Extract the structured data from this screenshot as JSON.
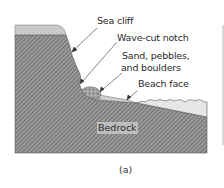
{
  "figure": {
    "caption": "(a)",
    "labels": {
      "sea_cliff": "Sea cliff",
      "wave_cut_notch": "Wave-cut notch",
      "sediment_line1": "Sand, pebbles,",
      "sediment_line2": "and boulders",
      "beach_face": "Beach face",
      "bedrock": "Bedrock"
    },
    "colors": {
      "bedrock_fill": "#8f8f8f",
      "bedrock_hatch": "#5e5e5e",
      "topsoil": "#c9c9c9",
      "water": "#e4e4e4",
      "beach": "#cfcfcf",
      "sediment": "#a8a8a8",
      "leader_line": "#333333"
    }
  }
}
